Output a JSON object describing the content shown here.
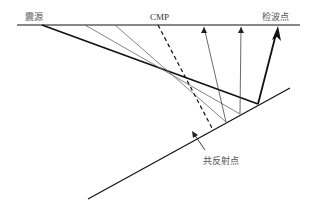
{
  "diagram": {
    "labels": {
      "source": "震源",
      "cmp": "CMP",
      "receiver": "检波点",
      "common_reflection_point": "共反射点"
    },
    "colors": {
      "line": "#111111",
      "thin_ray": "#555555",
      "label": "#555555"
    },
    "elements": {
      "surface_line": "地表",
      "reflector": "倾斜反射界面",
      "cmp_normal": "CMP 法线（虚线）",
      "rays": [
        "下行射线",
        "上行射线（箭头指向检波点）"
      ]
    }
  }
}
